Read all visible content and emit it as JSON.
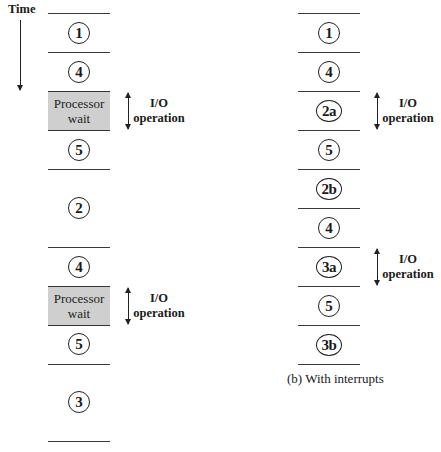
{
  "time_label": "Time",
  "left": {
    "segments": [
      {
        "type": "step",
        "label": "1"
      },
      {
        "type": "step",
        "label": "4"
      },
      {
        "type": "wait",
        "lines": [
          "Processor",
          "wait"
        ],
        "io": [
          "I/O",
          "operation"
        ]
      },
      {
        "type": "step",
        "label": "5"
      },
      {
        "type": "step",
        "label": "2"
      },
      {
        "type": "step",
        "label": "4"
      },
      {
        "type": "wait",
        "lines": [
          "Processor",
          "wait"
        ],
        "io": [
          "I/O",
          "operation"
        ]
      },
      {
        "type": "step",
        "label": "5"
      },
      {
        "type": "step",
        "label": "3"
      }
    ]
  },
  "right": {
    "segments": [
      {
        "label": "1"
      },
      {
        "label": "4"
      },
      {
        "label": "2a",
        "io": [
          "I/O",
          "operation"
        ]
      },
      {
        "label": "5"
      },
      {
        "label": "2b"
      },
      {
        "label": "4"
      },
      {
        "label": "3a",
        "io": [
          "I/O",
          "operation"
        ]
      },
      {
        "label": "5"
      },
      {
        "label": "3b"
      }
    ],
    "caption": "(b) With interrupts"
  },
  "colors": {
    "wait_fill": "#cfcfcf",
    "line": "#3a3a3a"
  }
}
